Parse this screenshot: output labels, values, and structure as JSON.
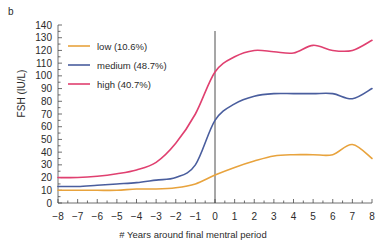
{
  "panel": {
    "label": "b"
  },
  "chart_data": {
    "type": "line",
    "title": "",
    "xlabel": "# Years around final mentral period",
    "ylabel": "FSH (IU/L)",
    "xlim": [
      -8,
      8
    ],
    "ylim": [
      0,
      140
    ],
    "ytick_step": 10,
    "grid": false,
    "legend_position": "top-left",
    "reference_line_x": 0,
    "xticks": [
      -8,
      -7,
      -6,
      -5,
      -4,
      -3,
      -2,
      -1,
      0,
      1,
      2,
      3,
      4,
      5,
      6,
      7,
      8
    ],
    "xtick_labels": [
      "−8",
      "−7",
      "−6",
      "−5",
      "−4",
      "−3",
      "−2",
      "−1",
      "0",
      "1",
      "2",
      "3",
      "4",
      "5",
      "6",
      "7",
      "8"
    ],
    "yticks": [
      0,
      10,
      20,
      30,
      40,
      50,
      60,
      70,
      80,
      90,
      100,
      110,
      120,
      130,
      140
    ],
    "ytick_labels": [
      "0",
      "10",
      "20",
      "30",
      "40",
      "50",
      "60",
      "70",
      "80",
      "90",
      "100",
      "110",
      "120",
      "130",
      "140"
    ],
    "x": [
      -8,
      -7,
      -6,
      -5,
      -4,
      -3,
      -2,
      -1,
      0,
      1,
      2,
      3,
      4,
      5,
      6,
      7,
      8
    ],
    "series": [
      {
        "name": "low",
        "percent": "10.6%",
        "label": "low (10.6%)",
        "color": "#E8A33D",
        "values": [
          10,
          10,
          10,
          10,
          11,
          11,
          12,
          15,
          22,
          28,
          33,
          37,
          38,
          38,
          38,
          46,
          35
        ]
      },
      {
        "name": "medium",
        "percent": "48.7%",
        "label": "medium (48.7%)",
        "color": "#4A5E9E",
        "values": [
          13,
          13,
          14,
          15,
          16,
          18,
          20,
          30,
          65,
          78,
          84,
          86,
          86,
          86,
          86,
          82,
          90
        ]
      },
      {
        "name": "high",
        "percent": "40.7%",
        "label": "high (40.7%)",
        "color": "#E04070",
        "values": [
          20,
          20,
          21,
          23,
          26,
          32,
          47,
          70,
          103,
          115,
          120,
          119,
          118,
          124,
          120,
          120,
          128
        ]
      }
    ]
  }
}
